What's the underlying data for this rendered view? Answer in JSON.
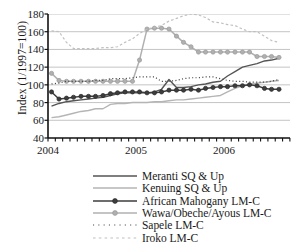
{
  "chart_data": {
    "type": "line",
    "title": "",
    "xlabel": "",
    "ylabel": "Index (1/1997=100)",
    "ylim": [
      40,
      180
    ],
    "yticks": [
      40,
      60,
      80,
      100,
      120,
      140,
      160,
      180
    ],
    "xlim": [
      2004.0,
      2006.75
    ],
    "xticks": [
      2004,
      2005,
      2006
    ],
    "xticklabels": [
      "2004",
      "2005",
      "2006"
    ],
    "x_minor_tick_interval": 0.0833,
    "grid": "horizontal",
    "legend_position": "below",
    "x": [
      2004.04,
      2004.125,
      2004.21,
      2004.29,
      2004.375,
      2004.46,
      2004.54,
      2004.625,
      2004.71,
      2004.79,
      2004.875,
      2004.96,
      2005.04,
      2005.125,
      2005.21,
      2005.29,
      2005.375,
      2005.46,
      2005.54,
      2005.625,
      2005.71,
      2005.79,
      2005.875,
      2005.96,
      2006.04,
      2006.125,
      2006.21,
      2006.29,
      2006.375,
      2006.46,
      2006.54,
      2006.625
    ],
    "series": [
      {
        "name": "Meranti SQ & Up",
        "color": "#555555",
        "style": "solid",
        "marker": "none",
        "values": [
          76,
          79,
          81,
          82,
          83,
          84,
          85,
          86,
          88,
          90,
          91,
          91,
          91,
          91,
          92,
          95,
          106,
          97,
          97,
          98,
          100,
          101,
          103,
          104,
          110,
          115,
          120,
          122,
          124,
          127,
          128,
          130
        ]
      },
      {
        "name": "Kenuing SQ & Up",
        "color": "#b5b5b5",
        "style": "solid",
        "marker": "none",
        "values": [
          63,
          64,
          66,
          68,
          70,
          71,
          73,
          73,
          78,
          79,
          79,
          80,
          80,
          80,
          81,
          81,
          82,
          83,
          83,
          84,
          85,
          86,
          87,
          88,
          92,
          96,
          99,
          101,
          102,
          103,
          104,
          105
        ]
      },
      {
        "name": "African Mahogany LM-C",
        "color": "#3d3d3d",
        "style": "solid",
        "marker": "circle",
        "values": [
          92,
          84,
          85,
          86,
          87,
          87,
          87,
          88,
          90,
          91,
          92,
          92,
          92,
          91,
          91,
          92,
          94,
          94,
          94,
          95,
          94,
          96,
          97,
          98,
          98,
          99,
          99,
          100,
          99,
          96,
          95,
          95
        ]
      },
      {
        "name": "Wawa/Obeche/Ayous LM-C",
        "color": "#b0b0b0",
        "style": "solid",
        "marker": "circle",
        "values": [
          113,
          105,
          104,
          104,
          104,
          104,
          104,
          104,
          104,
          104,
          104,
          104,
          128,
          163,
          164,
          164,
          163,
          155,
          148,
          143,
          137,
          137,
          137,
          137,
          137,
          137,
          137,
          137,
          132,
          132,
          132,
          131
        ]
      },
      {
        "name": "Sapele LM-C",
        "color": "#4a4a4a",
        "style": "dotted",
        "marker": "none",
        "values": [
          101,
          102,
          104,
          104,
          104,
          104,
          105,
          105,
          107,
          107,
          107,
          108,
          109,
          109,
          109,
          104,
          104,
          105,
          107,
          108,
          108,
          109,
          109,
          107,
          105,
          104,
          104,
          103,
          103,
          103,
          104,
          106
        ]
      },
      {
        "name": "Iroko LM-C",
        "color": "#c0c0c0",
        "style": "dashed",
        "marker": "none",
        "values": [
          161,
          160,
          148,
          141,
          141,
          141,
          141,
          142,
          142,
          143,
          148,
          152,
          158,
          163,
          165,
          167,
          172,
          175,
          178,
          180,
          179,
          176,
          171,
          170,
          168,
          167,
          163,
          160,
          160,
          155,
          150,
          148
        ]
      }
    ]
  },
  "axis": {
    "ytick_labels": [
      "180",
      "160",
      "140",
      "120",
      "100",
      "80",
      "60",
      "40"
    ],
    "ylabel_text": "Index (1/1997=100)"
  },
  "legend": {
    "items": [
      {
        "label": "Meranti SQ & Up",
        "series": 0
      },
      {
        "label": "Kenuing SQ & Up",
        "series": 1
      },
      {
        "label": "African Mahogany LM-C",
        "series": 2
      },
      {
        "label": "Wawa/Obeche/Ayous LM-C",
        "series": 3
      },
      {
        "label": "Sapele LM-C",
        "series": 4
      },
      {
        "label": "Iroko LM-C",
        "series": 5
      }
    ]
  },
  "colors": {
    "grid": "#bdbdbd",
    "axis": "#111111",
    "background": "#ffffff"
  }
}
